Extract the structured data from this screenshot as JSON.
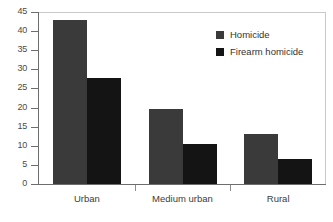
{
  "chart_data": {
    "type": "bar",
    "title": "",
    "xlabel": "",
    "ylabel": "",
    "categories": [
      "Urban",
      "Medium urban",
      "Rural"
    ],
    "series": [
      {
        "name": "Homicide",
        "color": "#3a3a3a",
        "values": [
          43,
          19.5,
          13
        ]
      },
      {
        "name": "Firearm homicide",
        "color": "#141414",
        "values": [
          27.8,
          10.5,
          6.5
        ]
      }
    ],
    "ylim": [
      0,
      45
    ],
    "yticks": [
      0,
      5,
      10,
      15,
      20,
      25,
      30,
      35,
      40,
      45
    ],
    "ytick_labels": [
      "0",
      "5",
      "10",
      "15",
      "20",
      "25",
      "30",
      "35",
      "40",
      "45"
    ],
    "grid": false,
    "legend_position": "top-right"
  }
}
